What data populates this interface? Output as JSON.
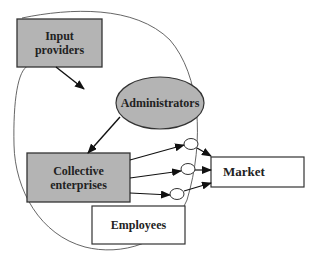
{
  "diagram": {
    "nodes": {
      "input_providers": {
        "label_line1": "Input",
        "label_line2": "providers",
        "shape": "rectangle",
        "fill": "#b4b4b4"
      },
      "administrators": {
        "label": "Administrators",
        "shape": "ellipse",
        "fill": "#b4b4b4"
      },
      "collective_enterprises": {
        "label_line1": "Collective",
        "label_line2": "enterprises",
        "shape": "rectangle",
        "fill": "#b4b4b4"
      },
      "employees": {
        "label": "Employees",
        "shape": "rectangle",
        "fill": "#ffffff"
      },
      "market": {
        "label": "Market",
        "shape": "rectangle",
        "fill": "#ffffff"
      }
    },
    "edges": [
      {
        "from": "input_providers",
        "to": "administrators"
      },
      {
        "from": "administrators",
        "to": "collective_enterprises"
      },
      {
        "from": "collective_enterprises",
        "to": "market",
        "via": "junction-1"
      },
      {
        "from": "collective_enterprises",
        "to": "market",
        "via": "junction-2"
      },
      {
        "from": "collective_enterprises",
        "to": "market",
        "via": "junction-3"
      }
    ],
    "boundary": "large closed curve enclosing input providers, administrators, collective enterprises"
  }
}
